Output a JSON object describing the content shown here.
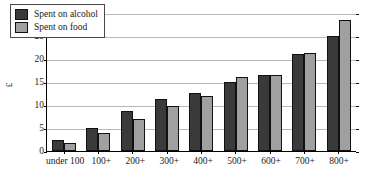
{
  "chart_data": {
    "type": "bar",
    "title": "",
    "xlabel": "",
    "ylabel": "£",
    "ylim": [
      0,
      30
    ],
    "ytick_step": 5,
    "yticks": [
      "0",
      "5",
      "10",
      "15",
      "20",
      "25",
      "30"
    ],
    "grid": true,
    "legend_position": "top-left",
    "categories": [
      "under 100",
      "100+",
      "200+",
      "300+",
      "400+",
      "500+",
      "600+",
      "700+",
      "800+"
    ],
    "series": [
      {
        "name": "Spent on alcohol",
        "color": "#3a3a3a",
        "values": [
          2.4,
          4.9,
          8.6,
          11.3,
          12.7,
          15.0,
          16.5,
          21.0,
          25.0
        ]
      },
      {
        "name": "Spent on food",
        "color": "#a0a0a0",
        "values": [
          1.7,
          3.9,
          7.0,
          9.7,
          12.0,
          16.0,
          16.5,
          21.2,
          28.5
        ]
      }
    ]
  }
}
